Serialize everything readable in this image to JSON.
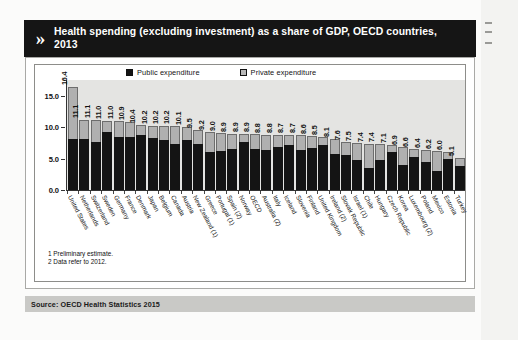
{
  "header": {
    "chevron_icon": "double-chevron-right-icon",
    "title": "Health spending (excluding investment) as a share of GDP, OECD countries, 2013"
  },
  "legend": {
    "public_label": "Public expenditure",
    "private_label": "Private expenditure"
  },
  "footnotes": [
    "1 Preliminary estimate.",
    "2 Data refer to 2012."
  ],
  "source": "Source: OECD Health Statistics 2015",
  "colors": {
    "public": "#141414",
    "private": "#b0b0b0",
    "header_background": "#151515",
    "plot_background": "#e4e4e2",
    "source_background": "#c9c9c6"
  },
  "chart_data": {
    "type": "bar",
    "title": "Health spending (excluding investment) as a share of GDP, OECD countries, 2013",
    "subtitle": "",
    "xlabel": "",
    "ylabel": "",
    "ylim": [
      0,
      17.5
    ],
    "yticks": [
      "0.0",
      "5.0",
      "10.0",
      "15.0"
    ],
    "grid": false,
    "stacked": true,
    "legend_position": "top",
    "categories": [
      "United States",
      "Netherlands",
      "Switzerland",
      "Sweden",
      "Germany",
      "France",
      "Denmark",
      "Japan",
      "Belgium",
      "Canada",
      "Austria",
      "New Zealand (1)",
      "Greece",
      "Portugal (1)",
      "Spain (2)",
      "Norway",
      "OECD",
      "Australia (2)",
      "Italy",
      "Iceland",
      "Slovenia",
      "Finland",
      "United Kingdom",
      "Ireland (2)",
      "Slovak Republic",
      "Israel (1)",
      "Chile",
      "Hungary",
      "Czech Republic",
      "Korea",
      "Luxembourg (2)",
      "Poland",
      "Mexico",
      "Estonia",
      "Turkey"
    ],
    "totals": [
      16.4,
      11.1,
      11.1,
      11.0,
      11.0,
      10.9,
      10.4,
      10.2,
      10.2,
      10.2,
      10.1,
      9.5,
      9.2,
      9.0,
      8.9,
      8.9,
      8.9,
      8.8,
      8.8,
      8.7,
      8.7,
      8.6,
      8.5,
      8.1,
      7.6,
      7.5,
      7.4,
      7.4,
      7.1,
      6.9,
      6.6,
      6.4,
      6.2,
      6.0,
      5.1
    ],
    "series": [
      {
        "name": "Public expenditure",
        "values": [
          8.1,
          8.1,
          7.6,
          9.2,
          8.4,
          8.5,
          8.8,
          8.2,
          8.0,
          7.3,
          7.9,
          7.3,
          6.0,
          6.2,
          6.5,
          7.6,
          6.5,
          6.3,
          6.9,
          7.1,
          6.3,
          6.7,
          7.2,
          5.7,
          5.5,
          4.7,
          3.5,
          4.8,
          6.0,
          4.0,
          5.3,
          4.5,
          3.1,
          5.0,
          3.9
        ]
      },
      {
        "name": "Private expenditure",
        "values": [
          8.3,
          3.0,
          3.5,
          1.8,
          2.6,
          2.4,
          1.6,
          2.0,
          2.2,
          2.9,
          2.2,
          2.2,
          3.2,
          2.8,
          2.4,
          1.3,
          2.4,
          2.5,
          1.9,
          1.6,
          2.4,
          1.9,
          1.3,
          2.4,
          2.1,
          2.8,
          3.9,
          2.6,
          1.1,
          2.9,
          1.3,
          1.9,
          3.1,
          1.0,
          1.2
        ]
      }
    ],
    "data_labels": [
      "16.4",
      "11.1",
      "11.1",
      "11.0",
      "11.0",
      "10.9",
      "10.4",
      "10.2",
      "10.2",
      "10.2",
      "10.1",
      "9.5",
      "9.2",
      "9.0",
      "8.9",
      "8.9",
      "8.9",
      "8.8",
      "8.8",
      "8.7",
      "8.7",
      "8.6",
      "8.5",
      "8.1",
      "7.6",
      "7.5",
      "7.4",
      "7.4",
      "7.1",
      "6.9",
      "6.6",
      "6.4",
      "6.2",
      "6.0",
      "5.1"
    ]
  }
}
